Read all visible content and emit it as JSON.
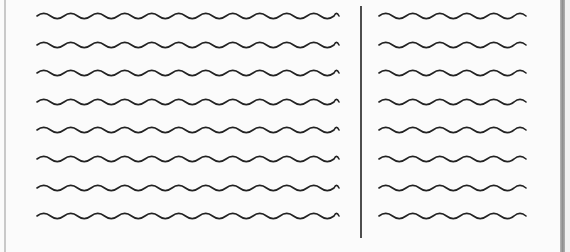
{
  "diagram": {
    "colors": {
      "background": "#fbfbfb",
      "stroke": "#222222",
      "edge_shadow": "#a0a0a0"
    },
    "left_column": {
      "x_start": 37,
      "x_end": 339,
      "line_count": 8
    },
    "right_column": {
      "x_start": 379,
      "x_end": 526,
      "line_count": 8
    },
    "divider": {
      "x": 361,
      "y_start": 6,
      "y_end": 238
    },
    "line_y": [
      16,
      45,
      73,
      102,
      130,
      159,
      188,
      216
    ],
    "wave": {
      "period": 27,
      "amplitude": 2.6,
      "stroke_width": 1.6
    }
  }
}
